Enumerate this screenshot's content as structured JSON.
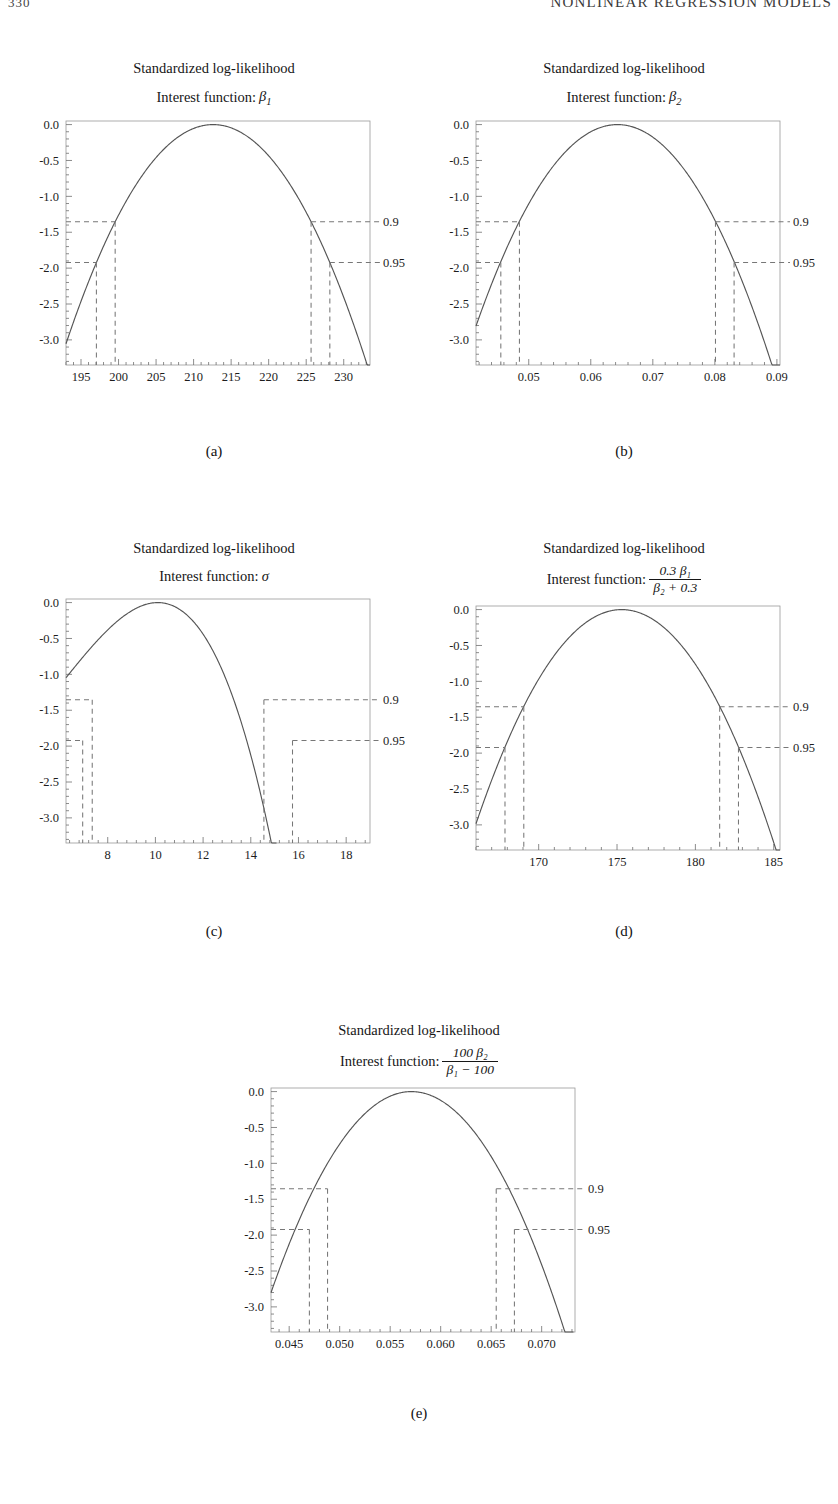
{
  "header": {
    "folio": "330",
    "running_title": "NONLINEAR REGRESSION MODELS"
  },
  "figure": {
    "common_title": "Standardized log-likelihood",
    "interest_prefix": "Interest function:",
    "confidence_labels": [
      "0.9",
      "0.95"
    ],
    "confidence_levels": [
      -1.353,
      -1.921
    ],
    "yticks": [
      "0.0",
      "-0.5",
      "-1.0",
      "-1.5",
      "-2.0",
      "-2.5",
      "-3.0"
    ],
    "ytick_values": [
      0.0,
      -0.5,
      -1.0,
      -1.5,
      -2.0,
      -2.5,
      -3.0
    ],
    "curve_color": "#555555",
    "dash_color": "#777777",
    "frame_color": "#9a9a9a"
  },
  "chart_data": [
    {
      "id": "a",
      "type": "line",
      "caption": "(a)",
      "title": "Standardized log-likelihood",
      "subtitle_prefix": "Interest function:",
      "interest_function": "β₁",
      "interest_kind": "symbol",
      "symbol_base": "β",
      "symbol_sub": "1",
      "xlabel": "",
      "ylabel": "",
      "xlim": [
        193.0,
        233.5
      ],
      "ylim": [
        -3.35,
        0.05
      ],
      "xticks": [
        195,
        200,
        205,
        210,
        215,
        220,
        225,
        230
      ],
      "xticklabels": [
        "195",
        "200",
        "205",
        "210",
        "215",
        "220",
        "225",
        "230"
      ],
      "yticks": [
        0.0,
        -0.5,
        -1.0,
        -1.5,
        -2.0,
        -2.5,
        -3.0
      ],
      "yticklabels": [
        "0.0",
        "-0.5",
        "-1.0",
        "-1.5",
        "-2.0",
        "-2.5",
        "-3.0"
      ],
      "peak_x": 212.6,
      "peak_y": 0.0,
      "curvature": -0.00795,
      "skew": 0.0,
      "grid": false,
      "ci_rows": [
        {
          "level": "0.9",
          "y": -1.353,
          "x_lower": 199.55,
          "x_upper": 225.65
        },
        {
          "level": "0.95",
          "y": -1.921,
          "x_lower": 197.05,
          "x_upper": 228.15
        }
      ]
    },
    {
      "id": "b",
      "type": "line",
      "caption": "(b)",
      "title": "Standardized log-likelihood",
      "subtitle_prefix": "Interest function:",
      "interest_function": "β₂",
      "interest_kind": "symbol",
      "symbol_base": "β",
      "symbol_sub": "2",
      "xlabel": "",
      "ylabel": "",
      "xlim": [
        0.0415,
        0.0905
      ],
      "ylim": [
        -3.35,
        0.05
      ],
      "xticks": [
        0.05,
        0.06,
        0.07,
        0.08,
        0.09
      ],
      "xticklabels": [
        "0.05",
        "0.06",
        "0.07",
        "0.08",
        "0.09"
      ],
      "yticks": [
        0.0,
        -0.5,
        -1.0,
        -1.5,
        -2.0,
        -2.5,
        -3.0
      ],
      "yticklabels": [
        "0.0",
        "-0.5",
        "-1.0",
        "-1.5",
        "-2.0",
        "-2.5",
        "-3.0"
      ],
      "peak_x": 0.0643,
      "peak_y": 0.0,
      "curvature": -5400.0,
      "skew": 0.0,
      "grid": false,
      "ci_rows": [
        {
          "level": "0.9",
          "y": -1.353,
          "x_lower": 0.0485,
          "x_upper": 0.0801
        },
        {
          "level": "0.95",
          "y": -1.921,
          "x_lower": 0.0455,
          "x_upper": 0.0831
        }
      ]
    },
    {
      "id": "c",
      "type": "line",
      "caption": "(c)",
      "title": "Standardized log-likelihood",
      "subtitle_prefix": "Interest function:",
      "interest_function": "σ",
      "interest_kind": "symbol",
      "symbol_base": "σ",
      "symbol_sub": "",
      "xlabel": "",
      "ylabel": "",
      "xlim": [
        6.25,
        19.0
      ],
      "ylim": [
        -3.35,
        0.05
      ],
      "xticks": [
        8,
        10,
        12,
        14,
        16,
        18
      ],
      "xticklabels": [
        "8",
        "10",
        "12",
        "14",
        "16",
        "18"
      ],
      "yticks": [
        0.0,
        -0.5,
        -1.0,
        -1.5,
        -2.0,
        -2.5,
        -3.0
      ],
      "yticklabels": [
        "0.0",
        "-0.5",
        "-1.0",
        "-1.5",
        "-2.0",
        "-2.5",
        "-3.0"
      ],
      "peak_x": 10.1,
      "peak_y": 0.0,
      "curvature": -0.105,
      "skew": 0.085,
      "grid": false,
      "ci_rows": [
        {
          "level": "0.9",
          "y": -1.353,
          "x_lower": 7.35,
          "x_upper": 14.55
        },
        {
          "level": "0.95",
          "y": -1.921,
          "x_lower": 6.95,
          "x_upper": 15.75
        }
      ]
    },
    {
      "id": "d",
      "type": "line",
      "caption": "(d)",
      "title": "Standardized log-likelihood",
      "subtitle_prefix": "Interest function:",
      "interest_function": "0.3β₁ / (β₂ + 0.3)",
      "interest_kind": "fraction",
      "numerator": "0.3 β₁",
      "denominator": "β₂ + 0.3",
      "xlabel": "",
      "ylabel": "",
      "xlim": [
        166.0,
        185.4
      ],
      "ylim": [
        -3.35,
        0.05
      ],
      "xticks": [
        170,
        175,
        180,
        185
      ],
      "xticklabels": [
        "170",
        "175",
        "180",
        "185"
      ],
      "yticks": [
        0.0,
        -0.5,
        -1.0,
        -1.5,
        -2.0,
        -2.5,
        -3.0
      ],
      "yticklabels": [
        "0.0",
        "-0.5",
        "-1.0",
        "-1.5",
        "-2.0",
        "-2.5",
        "-3.0"
      ],
      "peak_x": 175.3,
      "peak_y": 0.0,
      "curvature": -0.0345,
      "skew": 0.0,
      "grid": false,
      "ci_rows": [
        {
          "level": "0.9",
          "y": -1.353,
          "x_lower": 169.05,
          "x_upper": 181.55
        },
        {
          "level": "0.95",
          "y": -1.921,
          "x_lower": 167.85,
          "x_upper": 182.75
        }
      ]
    },
    {
      "id": "e",
      "type": "line",
      "caption": "(e)",
      "title": "Standardized log-likelihood",
      "subtitle_prefix": "Interest function:",
      "interest_function": "100β₂ / (β₁ - 100)",
      "interest_kind": "fraction",
      "numerator": "100 β₂",
      "denominator": "β₁ − 100",
      "xlabel": "",
      "ylabel": "",
      "xlim": [
        0.0432,
        0.0733
      ],
      "ylim": [
        -3.35,
        0.05
      ],
      "xticks": [
        0.045,
        0.05,
        0.055,
        0.06,
        0.065,
        0.07
      ],
      "xticklabels": [
        "0.045",
        "0.050",
        "0.055",
        "0.060",
        "0.065",
        "0.070"
      ],
      "yticks": [
        0.0,
        -0.5,
        -1.0,
        -1.5,
        -2.0,
        -2.5,
        -3.0
      ],
      "yticklabels": [
        "0.0",
        "-0.5",
        "-1.0",
        "-1.5",
        "-2.0",
        "-2.5",
        "-3.0"
      ],
      "peak_x": 0.0571,
      "peak_y": 0.0,
      "curvature": -14500.0,
      "skew": 0.0,
      "grid": false,
      "ci_rows": [
        {
          "level": "0.9",
          "y": -1.353,
          "x_lower": 0.0488,
          "x_upper": 0.0655
        },
        {
          "level": "0.95",
          "y": -1.921,
          "x_lower": 0.047,
          "x_upper": 0.0673
        }
      ]
    }
  ]
}
